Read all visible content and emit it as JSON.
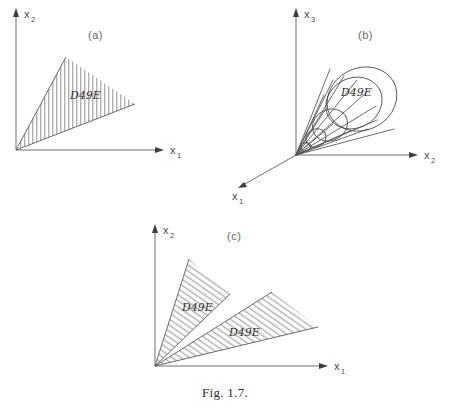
{
  "figure": {
    "caption": "Fig. 1.7.",
    "cone_symbol": "\u0001D49E"
  },
  "panels": [
    {
      "id": "a",
      "label": "(a)",
      "dimension": "2D",
      "description": "Planar convex cone with vertex at the origin, shaded with vertical hatching",
      "axes": [
        {
          "name": "x-vertical",
          "base": "x",
          "subscript": "2"
        },
        {
          "name": "x-horizontal",
          "base": "x",
          "subscript": "1"
        }
      ],
      "regions": [
        {
          "name": "cone-C",
          "symbol": "\u0001D49E",
          "hatching": "vertical"
        }
      ]
    },
    {
      "id": "b",
      "label": "(b)",
      "dimension": "3D",
      "description": "Three-dimensional circular cone drawn as a wireframe mesh with its apex at the origin",
      "axes": [
        {
          "name": "x-vertical",
          "base": "x",
          "subscript": "3"
        },
        {
          "name": "x-horizontal",
          "base": "x",
          "subscript": "2"
        },
        {
          "name": "x-depth",
          "base": "x",
          "subscript": "1"
        }
      ],
      "regions": [
        {
          "name": "cone-C",
          "symbol": "\u0001D49E",
          "hatching": "mesh"
        }
      ]
    },
    {
      "id": "c",
      "label": "(c)",
      "dimension": "2D",
      "description": "Two disjoint planar cones sharing a common vertex at the origin, both shaded with diagonal hatching",
      "axes": [
        {
          "name": "x-vertical",
          "base": "x",
          "subscript": "2"
        },
        {
          "name": "x-horizontal",
          "base": "x",
          "subscript": "1"
        }
      ],
      "regions": [
        {
          "name": "cone-C-upper",
          "symbol": "\u0001D49E",
          "hatching": "diagonal"
        },
        {
          "name": "cone-C-lower",
          "symbol": "\u0001D49E",
          "hatching": "diagonal"
        }
      ]
    }
  ]
}
